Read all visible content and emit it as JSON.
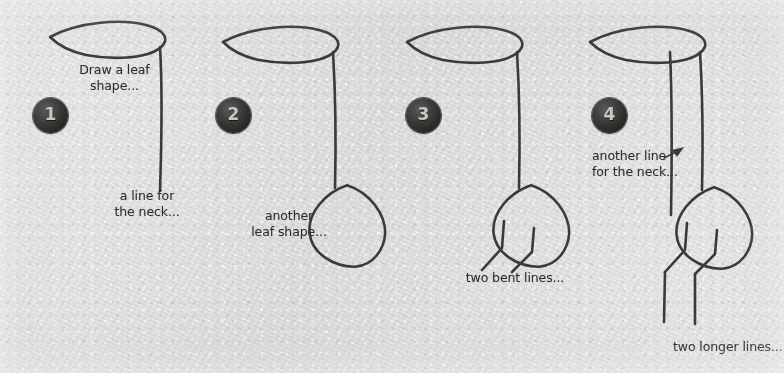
{
  "page": {
    "background_color": "#d9d9d8",
    "ink_color": "#3a3a38",
    "badge_color": "#262624",
    "badge_text_color": "#c9c9c4"
  },
  "steps": [
    {
      "number": "1",
      "badge_label": "1",
      "notes": [
        {
          "name": "note-draw-a-leaf-shape",
          "text": "Draw a leaf\nshape..."
        },
        {
          "name": "note-a-line-for-the-neck",
          "text": "a line for\nthe neck..."
        }
      ],
      "drawing_parts": [
        "leaf-head-shape",
        "neck-line"
      ]
    },
    {
      "number": "2",
      "badge_label": "2",
      "notes": [
        {
          "name": "note-another-leaf-shape",
          "text": "another\nleaf shape..."
        }
      ],
      "drawing_parts": [
        "leaf-head-shape",
        "neck-line",
        "body-leaf-shape"
      ]
    },
    {
      "number": "3",
      "badge_label": "3",
      "notes": [
        {
          "name": "note-two-bent-lines",
          "text": "two bent lines..."
        }
      ],
      "drawing_parts": [
        "leaf-head-shape",
        "neck-line",
        "body-leaf-shape",
        "two-bent-lines"
      ]
    },
    {
      "number": "4",
      "badge_label": "4",
      "notes": [
        {
          "name": "note-another-line-for-the-neck",
          "text": "another line\nfor the neck..."
        },
        {
          "name": "note-two-longer-lines",
          "text": "two longer lines..."
        }
      ],
      "drawing_parts": [
        "leaf-head-shape",
        "neck-line",
        "second-neck-line",
        "body-leaf-shape",
        "two-bent-lines",
        "two-longer-legs"
      ]
    }
  ]
}
